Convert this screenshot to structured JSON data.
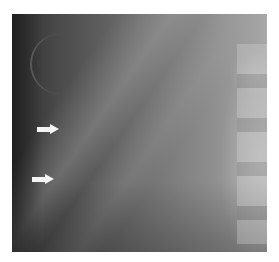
{
  "image": {
    "description": "Grayscale radiograph with two white arrows pointing right",
    "arrows": [
      {
        "label": "upper-arrow",
        "x": 37,
        "y": 124
      },
      {
        "label": "lower-arrow",
        "x": 32,
        "y": 174
      }
    ]
  }
}
